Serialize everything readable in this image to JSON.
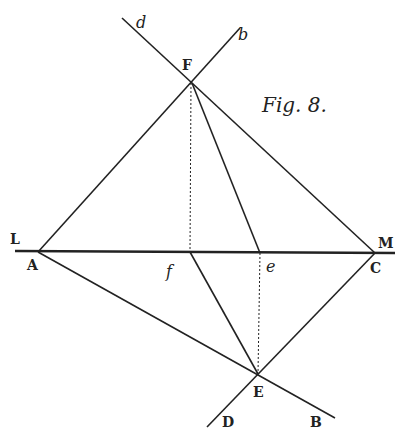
{
  "figure": {
    "caption": "Fig. 8.",
    "points": {
      "F": {
        "label": "F",
        "x": 192,
        "y": 83
      },
      "A": {
        "label": "A",
        "x": 38,
        "y": 252
      },
      "C": {
        "label": "C",
        "x": 375,
        "y": 253
      },
      "f": {
        "label": "f",
        "x": 190,
        "y": 252
      },
      "e": {
        "label": "e",
        "x": 260,
        "y": 253
      },
      "E": {
        "label": "E",
        "x": 258,
        "y": 374
      },
      "L": {
        "label": "L"
      },
      "M": {
        "label": "M"
      },
      "d": {
        "label": "d"
      },
      "b": {
        "label": "b"
      },
      "D": {
        "label": "D"
      },
      "B": {
        "label": "B"
      }
    },
    "colors": {
      "ink": "#222222",
      "paper": "#ffffff"
    }
  }
}
